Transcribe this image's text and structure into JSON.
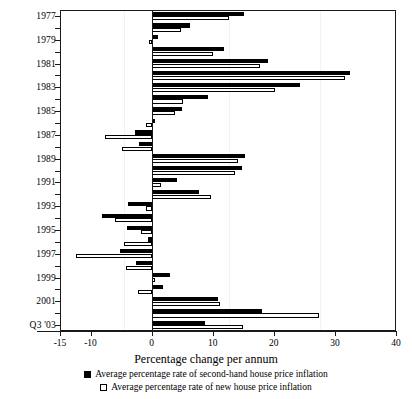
{
  "chart_data": {
    "type": "bar",
    "orientation": "horizontal",
    "title": "",
    "xlabel": "Percentage change per annum",
    "ylabel": "",
    "xlim": [
      -15,
      40
    ],
    "xticks": [
      -15,
      -10,
      0,
      10,
      20,
      30,
      40
    ],
    "xtick_labels": [
      "-15",
      "-10",
      "0",
      "10",
      "20",
      "30",
      "40"
    ],
    "grid": false,
    "legend_position": "below",
    "categories": [
      "1977",
      "1978",
      "1979",
      "1980",
      "1981",
      "1982",
      "1983",
      "1984",
      "1985",
      "1986",
      "1987",
      "1988",
      "1989",
      "1990",
      "1991",
      "1992",
      "1993",
      "1994",
      "1995",
      "1996",
      "1997",
      "1998",
      "1999",
      "2000",
      "2001",
      "2002",
      "Q3 '03"
    ],
    "ytick_labels": [
      "Q3 '03",
      "2001",
      "1999",
      "1997",
      "1995",
      "1993",
      "1991",
      "1989",
      "1987",
      "1985",
      "1983",
      "1981",
      "1979",
      "1977"
    ],
    "series": [
      {
        "name": "Average percentage rate of second-hand house price inflation",
        "color": "#000000",
        "style": "filled",
        "values": [
          8.8,
          18.0,
          10.8,
          1.8,
          3.0,
          -2.5,
          -5.2,
          -0.6,
          -4.0,
          -8.2,
          -3.8,
          7.8,
          4.2,
          14.8,
          15.3,
          -2.0,
          -2.8,
          0.5,
          5.0,
          9.2,
          24.3,
          32.5,
          19.0,
          11.8,
          1.0,
          6.2,
          15.1
        ]
      },
      {
        "name": "Average percentage rate of new house price inflation",
        "color": "#ffffff",
        "style": "outlined",
        "values": [
          14.9,
          27.4,
          11.2,
          -2.2,
          0.6,
          -4.2,
          -12.3,
          -4.6,
          -1.8,
          -6.0,
          -1.0,
          9.8,
          1.5,
          13.6,
          14.2,
          -4.8,
          -7.6,
          -1.0,
          3.8,
          5.2,
          20.2,
          31.6,
          17.8,
          10.0,
          -0.5,
          4.8,
          12.7
        ]
      }
    ]
  },
  "axis": {
    "x_title": "Percentage change per annum"
  },
  "legend": {
    "items": [
      {
        "swatch": "filled-black-square",
        "label": "Average percentage rate of second-hand house price inflation"
      },
      {
        "swatch": "outlined-white-square",
        "label": "Average percentage rate of new house price inflation"
      }
    ]
  }
}
